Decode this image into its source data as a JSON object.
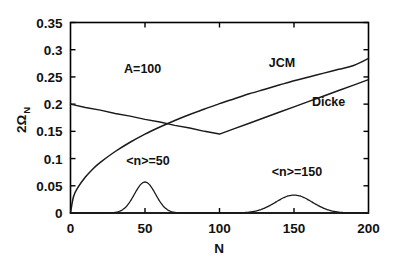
{
  "chart_data": {
    "type": "line",
    "title": "",
    "xlabel": "N",
    "ylabel": "2Ω",
    "ylabel_subscript": "N",
    "xlim": [
      0,
      200
    ],
    "ylim": [
      0,
      0.35
    ],
    "xticks": [
      0,
      50,
      100,
      150,
      200
    ],
    "xtick_labels": [
      "0",
      "50",
      "100",
      "150",
      "200"
    ],
    "yticks": [
      0,
      0.05,
      0.1,
      0.15,
      0.2,
      0.25,
      0.3,
      0.35
    ],
    "ytick_labels": [
      "0",
      "0.05",
      "0.1",
      "0.15",
      "0.2",
      "0.25",
      "0.3",
      "0.35"
    ],
    "grid": false,
    "legend_position": "inline-annotations",
    "annotations": [
      {
        "text": "A=100",
        "x": 36,
        "y": 0.258
      },
      {
        "text": "JCM",
        "x": 133,
        "y": 0.268
      },
      {
        "text": "Dicke",
        "x": 162,
        "y": 0.197
      },
      {
        "text": "<n>=50",
        "x": 52,
        "y": 0.088
      },
      {
        "text": "<n>=150",
        "x": 152,
        "y": 0.068
      }
    ],
    "series": [
      {
        "name": "JCM",
        "label": "JCM",
        "comment": "monotonically rising square-root-like curve from origin",
        "x": [
          0,
          2,
          5,
          10,
          15,
          20,
          30,
          40,
          50,
          60,
          70,
          80,
          90,
          100,
          110,
          120,
          130,
          140,
          150,
          160,
          170,
          180,
          190,
          200
        ],
        "y": [
          0.0,
          0.03,
          0.047,
          0.066,
          0.081,
          0.093,
          0.113,
          0.13,
          0.145,
          0.158,
          0.17,
          0.181,
          0.191,
          0.201,
          0.21,
          0.219,
          0.227,
          0.235,
          0.243,
          0.25,
          0.257,
          0.264,
          0.271,
          0.284
        ]
      },
      {
        "name": "Dicke",
        "label": "Dicke",
        "comment": "starts at 0.2, declines linearly to a minimum near N=100 then rises linearly",
        "x": [
          0,
          10,
          20,
          30,
          40,
          50,
          60,
          70,
          80,
          90,
          100,
          110,
          120,
          130,
          140,
          150,
          160,
          170,
          180,
          190,
          200
        ],
        "y": [
          0.2,
          0.194,
          0.189,
          0.183,
          0.178,
          0.172,
          0.167,
          0.161,
          0.156,
          0.15,
          0.145,
          0.155,
          0.165,
          0.175,
          0.185,
          0.195,
          0.205,
          0.215,
          0.225,
          0.235,
          0.245
        ]
      },
      {
        "name": "photon-distribution-n50",
        "label": "<n>=50",
        "comment": "Gaussian photon number distribution centred at N=50, peak 0.057, sigma ~7.1",
        "center": 50,
        "peak": 0.057,
        "sigma": 7.1
      },
      {
        "name": "photon-distribution-n150",
        "label": "<n>=150",
        "comment": "Gaussian photon number distribution centred at N=150, peak 0.033, sigma ~12.2",
        "center": 150,
        "peak": 0.033,
        "sigma": 12.2
      }
    ]
  },
  "colors": {
    "background": "#ffffff",
    "axis": "#000000",
    "curve": "#1a1a1a"
  }
}
